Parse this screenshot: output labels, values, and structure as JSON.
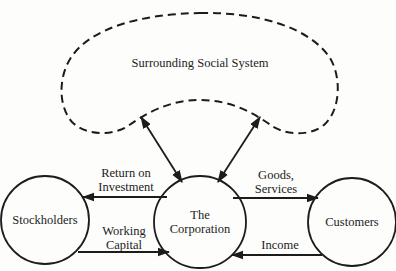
{
  "diagram": {
    "environment": {
      "label": "Surrounding Social System",
      "style": "dashed-cloud"
    },
    "nodes": [
      {
        "id": "stockholders",
        "label": "Stockholders"
      },
      {
        "id": "corporation",
        "label_line1": "The",
        "label_line2": "Corporation"
      },
      {
        "id": "customers",
        "label": "Customers"
      }
    ],
    "flows": [
      {
        "from": "corporation",
        "to": "stockholders",
        "label_line1": "Return on",
        "label_line2": "Investment"
      },
      {
        "from": "stockholders",
        "to": "corporation",
        "label_line1": "Working",
        "label_line2": "Capital"
      },
      {
        "from": "corporation",
        "to": "customers",
        "label_line1": "Goods,",
        "label_line2": "Services"
      },
      {
        "from": "customers",
        "to": "corporation",
        "label": "Income"
      },
      {
        "from": "environment",
        "to": "corporation",
        "direction": "bidirectional",
        "side": "left"
      },
      {
        "from": "environment",
        "to": "corporation",
        "direction": "bidirectional",
        "side": "right"
      }
    ],
    "colors": {
      "ink": "#1c1c1c",
      "background": "#fdfdfc"
    }
  }
}
